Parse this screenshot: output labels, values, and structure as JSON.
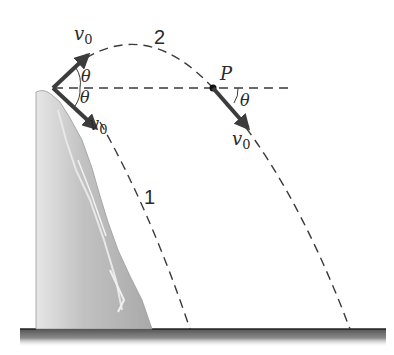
{
  "diagram": {
    "type": "projectile-from-cliff",
    "labels": {
      "v0_up": "v",
      "v0_up_sub": "0",
      "v0_down": "v",
      "v0_down_sub": "0",
      "v0_p": "v",
      "v0_p_sub": "0",
      "theta_up": "θ",
      "theta_down": "θ",
      "theta_p": "θ",
      "point": "P",
      "path_1": "1",
      "path_2": "2"
    },
    "colors": {
      "arrow": "#3c3c3c",
      "dash": "#3a3a3a",
      "cliff": "#b8b8b8",
      "ground": "#7a7a7a",
      "text": "#2a2a2a"
    }
  }
}
